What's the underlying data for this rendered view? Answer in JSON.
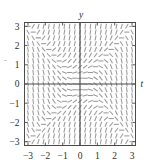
{
  "figure": {
    "kind": "direction-field-plot",
    "background_color": "#ffffff",
    "frame_color": "#4a4a4a",
    "segment_color": "#9a9a9a"
  },
  "chart_data": {
    "type": "scatter",
    "subtype": "direction-field",
    "title": "",
    "xlabel": "t",
    "ylabel": "y",
    "xlim": [
      -3.2,
      3.2
    ],
    "ylim": [
      -3.2,
      3.2
    ],
    "xticks": [
      -3,
      -2,
      -1,
      0,
      1,
      2,
      3
    ],
    "yticks": [
      -3,
      -2,
      -1,
      0,
      1,
      2,
      3
    ],
    "xticklabels": [
      "-3",
      "-2",
      "-1",
      "0",
      "1",
      "2",
      "3"
    ],
    "yticklabels": [
      "3",
      "2",
      "1",
      "0",
      "-1",
      "-2",
      "-3"
    ],
    "grid": false,
    "legend": null,
    "axes_through_origin": true,
    "tick_direction": "in",
    "ticks_all_sides": true,
    "slope_expression": "y^2 - t^2",
    "segment_grid_nx": 21,
    "segment_grid_ny": 21,
    "segment_domain_x": [
      -3.0,
      3.0
    ],
    "segment_domain_y": [
      -3.0,
      3.0
    ],
    "segment_length_px": 5.2,
    "x_axis_label_position": "right-end",
    "y_axis_label_position": "top-end"
  },
  "labels": {
    "x_axis": "t",
    "y_axis": "y",
    "x_ticks": [
      "-3",
      "-2",
      "-1",
      "0",
      "1",
      "2",
      "3"
    ],
    "y_ticks": [
      "3",
      "2",
      "1",
      "0",
      "-1",
      "-2",
      "-3"
    ]
  }
}
